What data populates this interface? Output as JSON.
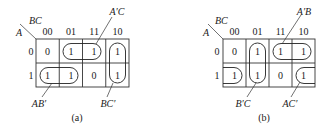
{
  "maps": [
    {
      "id": "a",
      "caption": "(a)",
      "row_var": "A",
      "col_var": "BC",
      "col_headers": [
        "00",
        "01",
        "11",
        "10"
      ],
      "row_headers": [
        "0",
        "1"
      ],
      "cells": [
        [
          "0",
          "1",
          "1",
          "1"
        ],
        [
          "1",
          "1",
          "0",
          "1"
        ]
      ],
      "groups": [
        {
          "term": "A′C",
          "cells": [
            [
              0,
              1
            ],
            [
              0,
              2
            ]
          ]
        },
        {
          "term": "BC′",
          "cells": [
            [
              0,
              3
            ],
            [
              1,
              3
            ]
          ]
        },
        {
          "term": "AB′",
          "cells": [
            [
              1,
              0
            ],
            [
              1,
              1
            ]
          ]
        }
      ]
    },
    {
      "id": "b",
      "caption": "(b)",
      "row_var": "A",
      "col_var": "BC",
      "col_headers": [
        "00",
        "01",
        "11",
        "10"
      ],
      "row_headers": [
        "0",
        "1"
      ],
      "cells": [
        [
          "0",
          "1",
          "1",
          "1"
        ],
        [
          "1",
          "1",
          "0",
          "1"
        ]
      ],
      "groups": [
        {
          "term": "A′B",
          "cells": [
            [
              0,
              2
            ],
            [
              0,
              3
            ]
          ]
        },
        {
          "term": "B′C",
          "cells": [
            [
              0,
              1
            ],
            [
              1,
              1
            ]
          ]
        },
        {
          "term": "AC′",
          "cells": [
            [
              1,
              0
            ],
            [
              1,
              3
            ]
          ],
          "wraps": true
        }
      ]
    }
  ]
}
